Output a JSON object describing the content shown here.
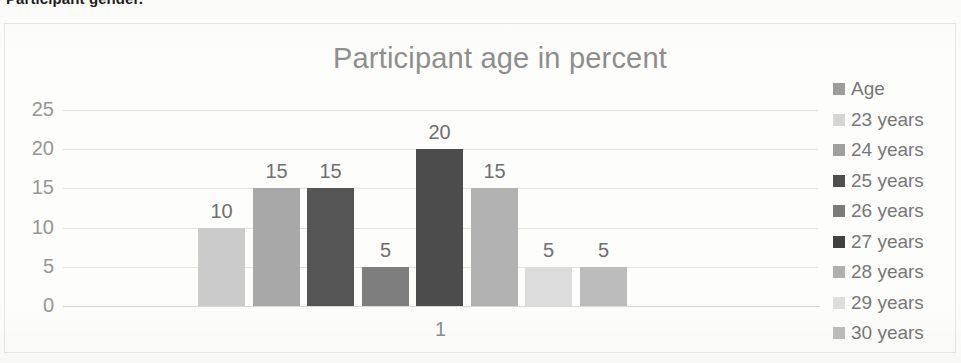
{
  "page": {
    "cutoff_caption": "Participant gender."
  },
  "chart_data": {
    "type": "bar",
    "title": "Participant age in percent",
    "xlabel": "",
    "ylabel": "",
    "categories": [
      "1"
    ],
    "x_tick_labels": [
      "1"
    ],
    "y_tick_labels": [
      "25",
      "20",
      "15",
      "10",
      "5",
      "0"
    ],
    "ylim": [
      0,
      25
    ],
    "y_tick_step": 5,
    "grid": true,
    "legend_position": "right",
    "series": [
      {
        "name": "Age",
        "value": null,
        "label": "",
        "color": "#9c9c9c"
      },
      {
        "name": "23 years",
        "value": 10,
        "label": "10",
        "color": "#cbcbcb"
      },
      {
        "name": "24 years",
        "value": 15,
        "label": "15",
        "color": "#a8a8a8"
      },
      {
        "name": "25 years",
        "value": 15,
        "label": "15",
        "color": "#555555"
      },
      {
        "name": "26 years",
        "value": 5,
        "label": "5",
        "color": "#7e7e7e"
      },
      {
        "name": "27 years",
        "value": 20,
        "label": "20",
        "color": "#4c4c4c"
      },
      {
        "name": "28 years",
        "value": 15,
        "label": "15",
        "color": "#b2b2b2"
      },
      {
        "name": "29 years",
        "value": 5,
        "label": "5",
        "color": "#dcdcdc"
      },
      {
        "name": "30 years",
        "value": 5,
        "label": "5",
        "color": "#bcbcbc"
      }
    ],
    "bar_values": [
      10,
      15,
      15,
      5,
      20,
      15,
      5,
      5
    ],
    "bar_labels": [
      "10",
      "15",
      "15",
      "5",
      "20",
      "15",
      "5",
      "5"
    ],
    "legend_entries": [
      {
        "label": "Age",
        "color": "#9c9c9c"
      },
      {
        "label": "23 years",
        "color": "#d5d5d5"
      },
      {
        "label": "24 years",
        "color": "#a0a0a0"
      },
      {
        "label": "25 years",
        "color": "#4f4f4f"
      },
      {
        "label": "26 years",
        "color": "#7b7b7b"
      },
      {
        "label": "27 years",
        "color": "#424242"
      },
      {
        "label": "28 years",
        "color": "#b0b0b0"
      },
      {
        "label": "29 years",
        "color": "#dedede"
      },
      {
        "label": "30 years",
        "color": "#bdbdbd"
      }
    ]
  }
}
